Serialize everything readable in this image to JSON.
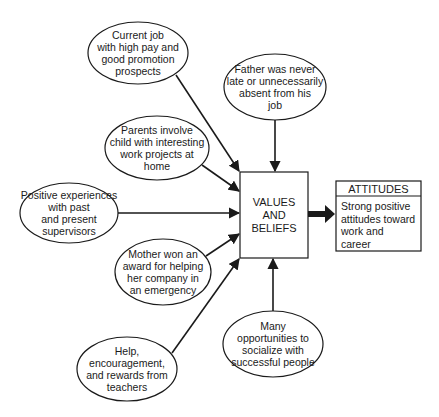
{
  "diagram": {
    "center": {
      "label": "VALUES\nAND\nBELIEFS"
    },
    "outcome": {
      "header": "ATTITUDES",
      "body": "Strong positive\nattitudes toward\nwork and\ncareer"
    },
    "influences": [
      {
        "id": "current-job",
        "label": "Current job\nwith high pay and\ngood promotion\nprospects"
      },
      {
        "id": "father",
        "label": "Father was never\nlate or unnecessarily\nabsent from his\njob"
      },
      {
        "id": "parents",
        "label": "Parents involve\nchild with interesting\nwork projects at\nhome"
      },
      {
        "id": "supervisors",
        "label": "Positive experiences\nwith past\nand present\nsupervisors"
      },
      {
        "id": "mother",
        "label": "Mother won an\naward for helping\nher company in\nan emergency"
      },
      {
        "id": "teachers",
        "label": "Help, encouragement,\nand rewards from\nteachers"
      },
      {
        "id": "socialize",
        "label": "Many\nopportunities to\nsocialize with\nsuccessful people"
      }
    ],
    "colors": {
      "stroke": "#1a1a1a",
      "background": "#ffffff"
    }
  }
}
